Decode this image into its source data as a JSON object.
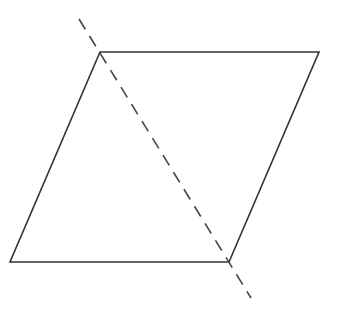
{
  "diagram": {
    "stroke_color": "#333333",
    "dash_color": "#444444",
    "background": "#ffffff",
    "shape": {
      "type": "parallelogram",
      "vertices": [
        [
          100,
          52
        ],
        [
          319,
          52
        ],
        [
          229,
          262
        ],
        [
          10,
          262
        ]
      ]
    },
    "dashed_line": {
      "from": [
        79,
        19
      ],
      "to": [
        251,
        298
      ],
      "dash": "12 8"
    }
  }
}
